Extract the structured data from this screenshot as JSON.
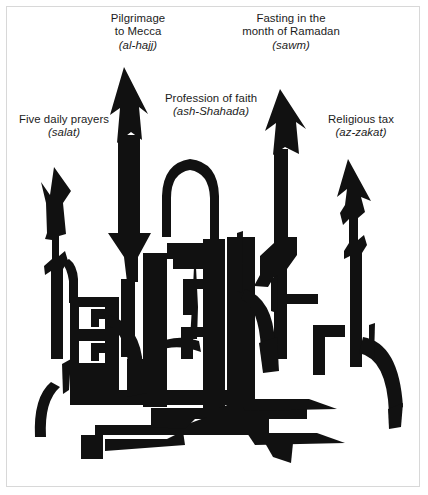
{
  "figure": {
    "ink_color": "#111111",
    "background_color": "#ffffff",
    "border_color": "#d8d8d8"
  },
  "labels": {
    "pilgrimage": {
      "name": "pilgrimage-label",
      "line1": "Pilgrimage",
      "line2": "to Mecca",
      "term": "(al-hajj)"
    },
    "fasting": {
      "name": "fasting-label",
      "line1": "Fasting in the",
      "line2": "month of Ramadan",
      "term": "(sawm)"
    },
    "profession": {
      "name": "profession-label",
      "line1": "Profession of faith",
      "line2": "",
      "term": "(ash-Shahada)"
    },
    "prayers": {
      "name": "prayers-label",
      "line1": "Five daily prayers",
      "line2": "",
      "term": "(salat)"
    },
    "tax": {
      "name": "tax-label",
      "line1": "Religious tax",
      "line2": "",
      "term": "(az-zakat)"
    }
  },
  "artwork": {
    "name": "mosque-silhouette",
    "elements": [
      "left-minaret",
      "tall-left-minaret",
      "central-spire",
      "central-dome",
      "tall-right-minaret",
      "right-minaret",
      "mosque-body",
      "arched-roofline"
    ]
  }
}
